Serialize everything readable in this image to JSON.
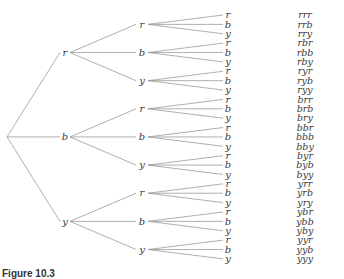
{
  "diagram": {
    "type": "tree",
    "colors": [
      "r",
      "b",
      "y"
    ],
    "root": "",
    "level1": [
      "r",
      "b",
      "y"
    ],
    "level2": [
      "r",
      "b",
      "y",
      "r",
      "b",
      "y",
      "r",
      "b",
      "y"
    ],
    "leaves": [
      "r",
      "b",
      "y",
      "r",
      "b",
      "y",
      "r",
      "b",
      "y",
      "r",
      "b",
      "y",
      "r",
      "b",
      "y",
      "r",
      "b",
      "y",
      "r",
      "b",
      "y",
      "r",
      "b",
      "y",
      "r",
      "b",
      "y"
    ],
    "outcomes": [
      "rrr",
      "rrb",
      "rry",
      "rbr",
      "rbb",
      "rby",
      "ryr",
      "ryb",
      "ryy",
      "brr",
      "brb",
      "bry",
      "bbr",
      "bbb",
      "bby",
      "byr",
      "byb",
      "byy",
      "yrr",
      "yrb",
      "yry",
      "ybr",
      "ybb",
      "yby",
      "yyr",
      "yyb",
      "yyy"
    ],
    "edge_color": "#9a9a9a",
    "text_color": "#3a3a3a"
  },
  "caption": "Figure 10.3"
}
